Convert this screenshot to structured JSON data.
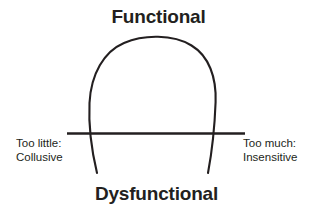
{
  "diagram": {
    "type": "inverted-u-curve",
    "background_color": "#ffffff",
    "ink_color": "#231f20",
    "top_title": "Functional",
    "bottom_title": "Dysfunctional",
    "left_label": {
      "line1": "Too little:",
      "line2": "Collusive"
    },
    "right_label": {
      "line1": "Too much:",
      "line2": "Insensitive"
    },
    "baseline": {
      "name": "horizontal-axis-line",
      "x_start": 67,
      "x_end": 245,
      "y": 133,
      "stroke_width": 2.6
    },
    "curve": {
      "name": "inverted-u-performance-curve",
      "apex_x": 158,
      "apex_y": 39,
      "left_end_x": 97,
      "left_end_y": 173,
      "right_end_x": 208,
      "right_end_y": 173,
      "left_crossing_x": 90,
      "right_crossing_x": 213,
      "stroke_width": 2.1
    }
  }
}
